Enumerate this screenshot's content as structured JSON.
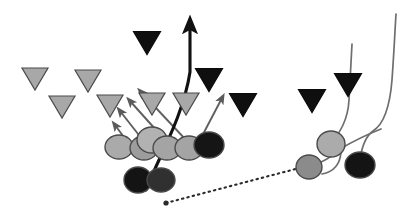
{
  "diagram": {
    "width": 419,
    "height": 214,
    "background_color": "#ffffff",
    "colors": {
      "light_gray_fill": "#aaaaaa",
      "mid_gray_fill": "#8f8f8f",
      "black_fill": "#121212",
      "outline": "#4a4a4a",
      "route_line": "#6e6e6e",
      "primary_path": "#111111",
      "pass_line": "#2b2b2b"
    },
    "legend": {
      "circle_meaning": "offensive player",
      "triangle_meaning": "defensive player",
      "solid_arrow_meaning": "blocking / run path",
      "dotted_line_meaning": "pass trajectory"
    }
  },
  "players": {
    "offense_line": [
      {
        "name": "offense-circle-1",
        "cx": 119,
        "cy": 147,
        "rx": 14,
        "ry": 12,
        "fill": "#aaaaaa"
      },
      {
        "name": "offense-circle-2",
        "cx": 144,
        "cy": 148,
        "rx": 14,
        "ry": 12,
        "fill": "#9d9d9d"
      },
      {
        "name": "offense-circle-3",
        "cx": 152,
        "cy": 140,
        "rx": 15,
        "ry": 13,
        "fill": "#b2b2b2"
      },
      {
        "name": "offense-circle-4",
        "cx": 167,
        "cy": 148,
        "rx": 14,
        "ry": 12,
        "fill": "#a4a4a4"
      },
      {
        "name": "offense-circle-5",
        "cx": 189,
        "cy": 148,
        "rx": 14,
        "ry": 12,
        "fill": "#a4a4a4"
      },
      {
        "name": "offense-circle-6",
        "cx": 209,
        "cy": 145,
        "rx": 15,
        "ry": 13,
        "fill": "#151515"
      }
    ],
    "backfield": [
      {
        "name": "backfield-circle-quarterback",
        "cx": 138,
        "cy": 180,
        "rx": 14,
        "ry": 13,
        "fill": "#141414"
      },
      {
        "name": "backfield-circle-runningback",
        "cx": 161,
        "cy": 180,
        "rx": 14,
        "ry": 12,
        "fill": "#303030"
      }
    ],
    "right_group": [
      {
        "name": "right-circle-receiver-upper",
        "cx": 331,
        "cy": 144,
        "rx": 14,
        "ry": 13,
        "fill": "#ababab"
      },
      {
        "name": "right-circle-receiver-lower",
        "cx": 309,
        "cy": 167,
        "rx": 13,
        "ry": 12,
        "fill": "#8b8b8b"
      },
      {
        "name": "right-circle-blocker-dark",
        "cx": 360,
        "cy": 165,
        "rx": 15,
        "ry": 13,
        "fill": "#141414"
      }
    ],
    "defense_light_triangles": [
      {
        "name": "defense-triangle-light-1",
        "cx": 35,
        "cy": 79,
        "w": 26,
        "h": 22,
        "fill": "#a8a8a8"
      },
      {
        "name": "defense-triangle-light-2",
        "cx": 88,
        "cy": 81,
        "w": 26,
        "h": 22,
        "fill": "#a8a8a8"
      },
      {
        "name": "defense-triangle-light-3",
        "cx": 62,
        "cy": 107,
        "w": 26,
        "h": 22,
        "fill": "#a8a8a8"
      },
      {
        "name": "defense-triangle-light-4",
        "cx": 110,
        "cy": 106,
        "w": 26,
        "h": 22,
        "fill": "#a8a8a8"
      },
      {
        "name": "defense-triangle-light-5",
        "cx": 152,
        "cy": 104,
        "w": 26,
        "h": 22,
        "fill": "#a8a8a8"
      },
      {
        "name": "defense-triangle-light-6",
        "cx": 186,
        "cy": 104,
        "w": 26,
        "h": 22,
        "fill": "#a8a8a8"
      }
    ],
    "defense_dark_triangles": [
      {
        "name": "defense-triangle-dark-1",
        "cx": 147,
        "cy": 43,
        "w": 27,
        "h": 23,
        "fill": "#0f0f0f"
      },
      {
        "name": "defense-triangle-dark-2",
        "cx": 209,
        "cy": 80,
        "w": 27,
        "h": 23,
        "fill": "#0f0f0f"
      },
      {
        "name": "defense-triangle-dark-3",
        "cx": 243,
        "cy": 105,
        "w": 27,
        "h": 23,
        "fill": "#0f0f0f"
      },
      {
        "name": "defense-triangle-dark-4",
        "cx": 312,
        "cy": 101,
        "w": 27,
        "h": 23,
        "fill": "#0f0f0f"
      },
      {
        "name": "defense-triangle-dark-5",
        "cx": 348,
        "cy": 85,
        "w": 27,
        "h": 23,
        "fill": "#0f0f0f"
      }
    ]
  },
  "routes": {
    "block_arrows": [
      {
        "name": "block-arrow-1",
        "path": "M 126 140 L 115 125"
      },
      {
        "name": "block-arrow-2",
        "path": "M 142 139 L 120 111"
      },
      {
        "name": "block-arrow-3",
        "path": "M 165 140 L 130 101"
      },
      {
        "name": "block-arrow-4",
        "path": "M 186 140 L 141 92"
      },
      {
        "name": "block-arrow-5",
        "path": "M 200 140 L 222 98"
      }
    ],
    "quarterback_run": {
      "name": "quarterback-run-path",
      "path": "M 146 190 C 157 160 183 118 190 72 L 190 25"
    },
    "pass_trajectory": {
      "name": "pass-trajectory-line",
      "path": "M 166 203 L 307 166"
    },
    "receiver_routes": [
      {
        "name": "receiver-route-1",
        "path": "M 309 167 C 322 162 335 157 338 146"
      },
      {
        "name": "receiver-route-2",
        "path": "M 331 144 C 340 132 348 120 349 100 C 350 80 351 60 352 44"
      },
      {
        "name": "receiver-route-3",
        "path": "M 360 160 C 362 145 366 136 373 131 C 384 124 390 105 392 80 C 394 52 395 30 396 14"
      },
      {
        "name": "receiver-route-4",
        "path": "M 322 174 C 333 172 340 166 341 152"
      },
      {
        "name": "receiver-route-5",
        "path": "M 338 150 C 352 142 368 134 381 129"
      }
    ]
  }
}
